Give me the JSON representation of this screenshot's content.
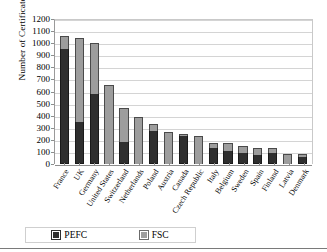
{
  "chart_data": {
    "type": "bar",
    "subtype": "stacked-column",
    "title": "",
    "xlabel": "",
    "ylabel": "Number of Certificates",
    "ylim": [
      0,
      1200
    ],
    "ytick_step": 100,
    "yticks": [
      0,
      100,
      200,
      300,
      400,
      500,
      600,
      700,
      800,
      900,
      1000,
      1100,
      1200
    ],
    "grid": true,
    "legend_position": "bottom-left",
    "categories": [
      "France",
      "UK",
      "Germany",
      "United States",
      "Switzerland",
      "Netherlands",
      "Poland",
      "Austria",
      "Canada",
      "Czech Republic",
      "Italy",
      "Belgium",
      "Sweden",
      "Spain",
      "Finland",
      "Latvia",
      "Denmark"
    ],
    "series": [
      {
        "name": "PEFC",
        "color": "#2f2f2f",
        "values": [
          950,
          345,
          580,
          0,
          180,
          0,
          275,
          0,
          235,
          0,
          130,
          105,
          95,
          75,
          95,
          0,
          55
        ]
      },
      {
        "name": "FSC",
        "color": "#9d9d9d",
        "values": [
          110,
          700,
          425,
          650,
          280,
          390,
          60,
          265,
          15,
          230,
          45,
          70,
          55,
          60,
          35,
          85,
          30
        ]
      }
    ],
    "totals": [
      1060,
      1045,
      1005,
      650,
      460,
      390,
      335,
      265,
      250,
      230,
      175,
      175,
      150,
      135,
      130,
      85,
      85
    ]
  },
  "legend": {
    "entries": [
      {
        "label": "PEFC",
        "color": "#2f2f2f"
      },
      {
        "label": "FSC",
        "color": "#9d9d9d"
      }
    ]
  }
}
